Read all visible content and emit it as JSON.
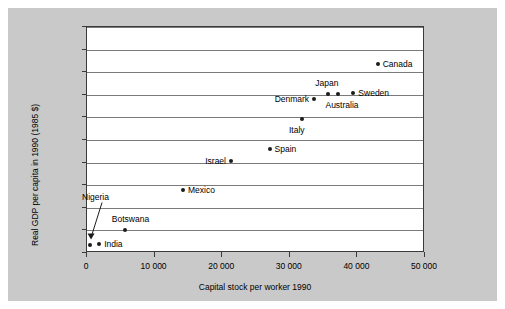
{
  "chart_data": {
    "type": "scatter",
    "title": "",
    "xlabel": "Capital stock per worker 1990",
    "ylabel": "Real GDP per capita in 1990 (1985 $)",
    "xlim": [
      0,
      50000
    ],
    "ylim": [
      0,
      20000
    ],
    "grid": true,
    "legend": "none",
    "xticks": [
      "0",
      "10 000",
      "20 000",
      "30 000",
      "40 000",
      "50 000"
    ],
    "xtick_values": [
      0,
      10000,
      20000,
      30000,
      40000,
      50000
    ],
    "yticks": [
      "0",
      "2000",
      "4000",
      "6000",
      "8000",
      "10 000",
      "12 000",
      "14 000",
      "16 000",
      "18 000",
      "20 000"
    ],
    "ytick_values": [
      0,
      2000,
      4000,
      6000,
      8000,
      10000,
      12000,
      14000,
      16000,
      18000,
      20000
    ],
    "points": [
      {
        "label": "Nigeria",
        "x": 450,
        "y": 750,
        "label_side": "callout"
      },
      {
        "label": "India",
        "x": 1800,
        "y": 800,
        "label_side": "right"
      },
      {
        "label": "Botswana",
        "x": 5600,
        "y": 2000,
        "label_side": "above"
      },
      {
        "label": "Mexico",
        "x": 14200,
        "y": 5600,
        "label_side": "right"
      },
      {
        "label": "Israel",
        "x": 21300,
        "y": 8100,
        "label_side": "left"
      },
      {
        "label": "Spain",
        "x": 27000,
        "y": 9200,
        "label_side": "right"
      },
      {
        "label": "Italy",
        "x": 31800,
        "y": 11900,
        "label_side": "below"
      },
      {
        "label": "Denmark",
        "x": 33600,
        "y": 13600,
        "label_side": "left"
      },
      {
        "label": "Japan",
        "x": 35700,
        "y": 14100,
        "label_side": "above"
      },
      {
        "label": "Australia",
        "x": 37200,
        "y": 14100,
        "label_side": "below"
      },
      {
        "label": "Sweden",
        "x": 39400,
        "y": 14200,
        "label_side": "right"
      },
      {
        "label": "Canada",
        "x": 43000,
        "y": 16700,
        "label_side": "right"
      }
    ],
    "annotations": [
      {
        "name": "nigeria-callout-arrow",
        "from_label": "Nigeria",
        "to_point": "Nigeria"
      }
    ],
    "colors": {
      "marker": "#1c1c1c",
      "grid": "#7a7a7a",
      "axis": "#3a3a3a",
      "plot_background": "#ffffff",
      "figure_background": "#c9c9c9"
    }
  }
}
